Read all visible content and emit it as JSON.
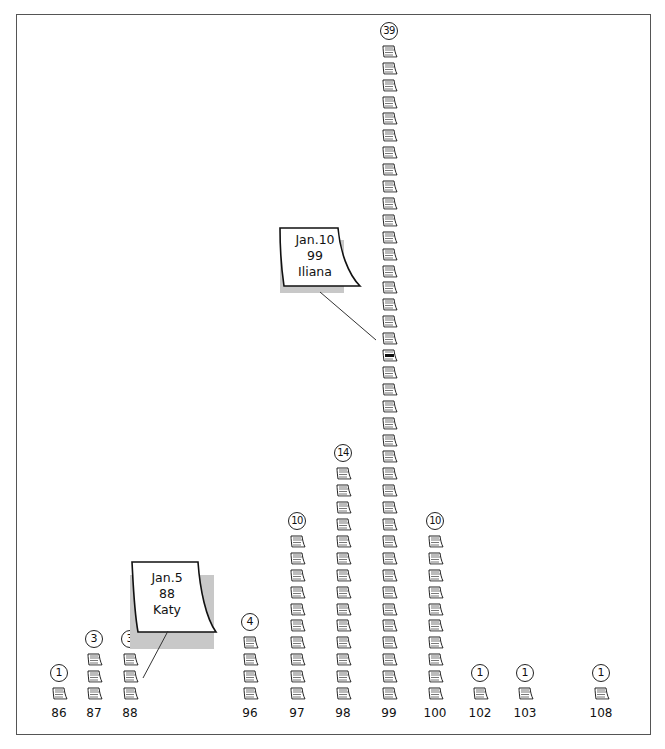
{
  "chart_data": {
    "type": "bar",
    "title": "",
    "xlabel": "",
    "ylabel": "",
    "style": "pictogram stacks of paper-note icons with circled counts",
    "categories": [
      "86",
      "87",
      "88",
      "96",
      "97",
      "98",
      "99",
      "100",
      "102",
      "103",
      "108"
    ],
    "values": [
      1,
      3,
      3,
      4,
      10,
      14,
      39,
      10,
      1,
      1,
      1
    ],
    "grid": false,
    "legend": null,
    "annotations": [
      {
        "lines": [
          "Jan.5",
          "88",
          "Katy"
        ],
        "points_to": "88"
      },
      {
        "lines": [
          "Jan.10",
          "99",
          "Iliana"
        ],
        "points_to": "99"
      }
    ],
    "highlighted_icon": {
      "category": "99",
      "index_from_bottom": 20
    }
  },
  "columns": [
    {
      "label": "86",
      "count": "1",
      "n": 1,
      "x": 59
    },
    {
      "label": "87",
      "count": "3",
      "n": 3,
      "x": 94
    },
    {
      "label": "88",
      "count": "3",
      "n": 3,
      "x": 130
    },
    {
      "label": "96",
      "count": "4",
      "n": 4,
      "x": 250
    },
    {
      "label": "97",
      "count": "10",
      "n": 10,
      "x": 297
    },
    {
      "label": "98",
      "count": "14",
      "n": 14,
      "x": 343
    },
    {
      "label": "99",
      "count": "39",
      "n": 39,
      "x": 389
    },
    {
      "label": "100",
      "count": "10",
      "n": 10,
      "x": 435
    },
    {
      "label": "102",
      "count": "1",
      "n": 1,
      "x": 480
    },
    {
      "label": "103",
      "count": "1",
      "n": 1,
      "x": 525
    },
    {
      "label": "108",
      "count": "1",
      "n": 1,
      "x": 601
    }
  ],
  "notes": [
    {
      "line1": "Jan.5",
      "line2": "88",
      "line3": "Katy"
    },
    {
      "line1": "Jan.10",
      "line2": "99",
      "line3": "Iliana"
    }
  ]
}
